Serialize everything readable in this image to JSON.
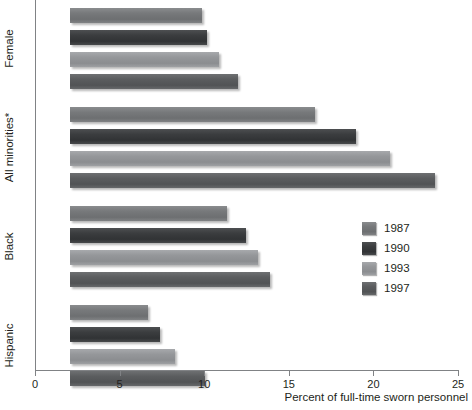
{
  "chart_data": {
    "type": "bar",
    "orientation": "horizontal",
    "title": "",
    "xlabel": "Percent of full-time sworn personnel",
    "ylabel": "",
    "xlim": [
      0,
      25
    ],
    "xticks": [
      0,
      5,
      10,
      15,
      20,
      25
    ],
    "xtick_labels": [
      "0",
      "5",
      "10",
      "15",
      "20",
      "25"
    ],
    "grid": false,
    "legend_position": "center-right",
    "categories": [
      "Female",
      "All minorities*",
      "Black",
      "Hispanic"
    ],
    "series": [
      {
        "name": "1987",
        "color": "#77797b",
        "values": [
          7.8,
          14.5,
          9.3,
          4.6
        ]
      },
      {
        "name": "1990",
        "color": "#3b3d3f",
        "values": [
          8.1,
          16.9,
          10.4,
          5.3
        ]
      },
      {
        "name": "1993",
        "color": "#95979a",
        "values": [
          8.8,
          18.9,
          11.1,
          6.2
        ]
      },
      {
        "name": "1997",
        "color": "#5b5d5f",
        "values": [
          9.9,
          21.6,
          11.8,
          8.0
        ]
      }
    ]
  },
  "legend": {
    "entries": [
      {
        "label": "1987"
      },
      {
        "label": "1990"
      },
      {
        "label": "1993"
      },
      {
        "label": "1997"
      }
    ]
  },
  "axis": {
    "x_title": "Percent of full-time sworn personnel"
  }
}
